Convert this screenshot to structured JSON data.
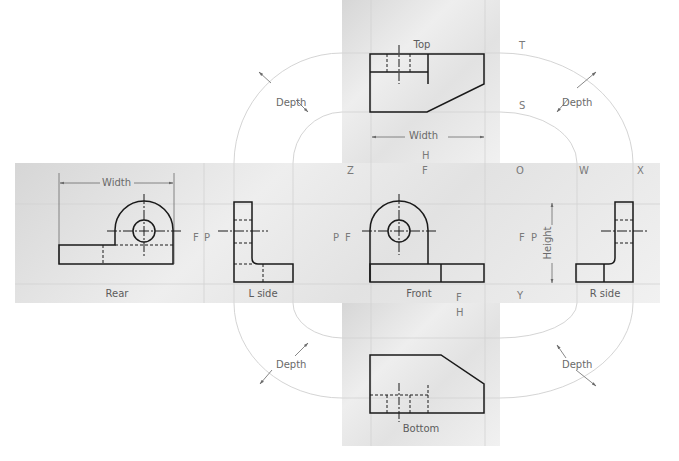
{
  "diagram": {
    "type": "glass-box-orthographic-projection",
    "views": {
      "top": "Top",
      "rear": "Rear",
      "left_side": "L side",
      "front": "Front",
      "right_side": "R side",
      "bottom": "Bottom"
    },
    "dimensions": {
      "width_top": "Width",
      "width_rear": "Width",
      "height": "Height",
      "depth_upper_left": "Depth",
      "depth_upper_right": "Depth",
      "depth_lower_left": "Depth",
      "depth_lower_right": "Depth"
    },
    "fold_line_labels": {
      "T": "T",
      "S": "S",
      "H_top": "H",
      "F_top": "F",
      "Z": "Z",
      "O": "O",
      "W": "W",
      "X": "X",
      "F_rear": "F",
      "P_lside_left": "P",
      "P_lside_right": "P",
      "F_front_left": "F",
      "F_front_right": "F",
      "P_rside": "P",
      "F_bottom": "F",
      "H_bottom": "H",
      "Y": "Y"
    },
    "colors": {
      "panel_gray": "#e4e4e4",
      "object_line": "#1a1a1a",
      "construction_line": "#c8c8c8",
      "label_gray": "#7a7a7a"
    }
  }
}
